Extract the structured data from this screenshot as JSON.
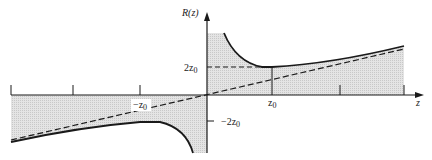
{
  "figure": {
    "y_axis_label": "R(z)",
    "x_axis_label": "z",
    "labels": {
      "two_z0": "2z",
      "two_z0_sub": "0",
      "neg_two_z0": "−2z",
      "neg_two_z0_sub": "0",
      "z0": "z",
      "z0_sub": "0",
      "neg_z0": "−z",
      "neg_z0_sub": "0"
    }
  },
  "colors": {
    "line": "#1a1a1a",
    "shade": "#d9d9d9"
  }
}
